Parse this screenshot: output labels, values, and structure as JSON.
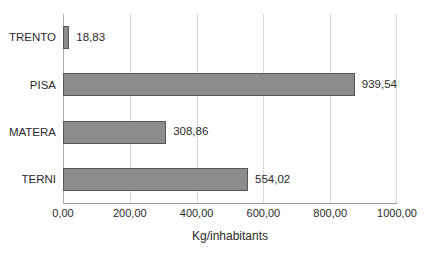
{
  "chart_data": {
    "type": "bar",
    "orientation": "horizontal",
    "title": "",
    "subtitle": "",
    "xlabel": "Kg/inhabitants",
    "ylabel": "",
    "categories": [
      "TRENTO",
      "PISA",
      "MATERA",
      "TERNI"
    ],
    "values": [
      18.83,
      939.54,
      308.86,
      554.02
    ],
    "value_labels": [
      "18,83",
      "939,54",
      "308,86",
      "554,02"
    ],
    "xlim": [
      0,
      1000
    ],
    "xticks": [
      0,
      200,
      400,
      600,
      800,
      1000
    ],
    "xtick_labels": [
      "0,00",
      "200,00",
      "400,00",
      "600,00",
      "800,00",
      "1000,00"
    ],
    "grid": true,
    "grid_axis": "x",
    "legend": false,
    "legend_position": "none",
    "bar_color": "#8c8c8c",
    "bar_border_color": "#575757",
    "gridline_color": "#d7d7d7",
    "background_color": "#ffffff",
    "text_color": "#2b2b2b"
  }
}
